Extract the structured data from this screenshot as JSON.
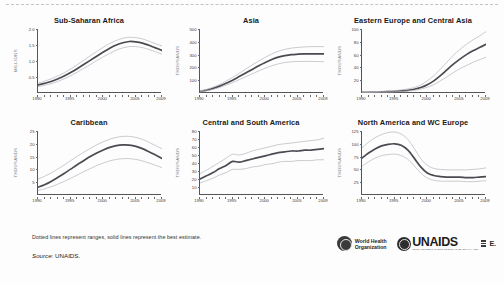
{
  "figure": {
    "note": "Dotted lines represent ranges, solid lines represent the best estimate.",
    "source_label": "Source:",
    "source_value": "UNAIDS."
  },
  "logos": {
    "who": {
      "line1": "World Health",
      "line2": "Organization",
      "mark": "who-emblem-icon"
    },
    "unaids": {
      "word": "UNAIDS",
      "subtitle": "JOINT UNITED NATIONS PROGRAMME ON HIV/AIDS",
      "mark": "unaids-emblem-icon"
    }
  },
  "chart_data": [
    {
      "type": "line",
      "title": "Sub-Saharan Africa",
      "xlabel": "",
      "ylabel": "MILLIONS",
      "xlim": [
        1990,
        2009
      ],
      "ylim": [
        0,
        2.0
      ],
      "xticks": [
        1990,
        1995,
        2000,
        2005,
        2009
      ],
      "yticks": [
        0.5,
        1.0,
        1.5,
        2.0
      ],
      "ytick_labels": [
        "0.5",
        "1.0",
        "1.5",
        "2.0"
      ],
      "grid": false,
      "legend": "none",
      "x": [
        1990,
        1991,
        1992,
        1993,
        1994,
        1995,
        1996,
        1997,
        1998,
        1999,
        2000,
        2001,
        2002,
        2003,
        2004,
        2005,
        2006,
        2007,
        2008,
        2009
      ],
      "series": [
        {
          "name": "best estimate",
          "style": "solid",
          "values": [
            0.25,
            0.3,
            0.36,
            0.44,
            0.53,
            0.64,
            0.76,
            0.89,
            1.02,
            1.15,
            1.28,
            1.4,
            1.5,
            1.57,
            1.61,
            1.6,
            1.56,
            1.49,
            1.41,
            1.33
          ]
        },
        {
          "name": "upper range",
          "style": "dotted",
          "values": [
            0.31,
            0.37,
            0.44,
            0.53,
            0.63,
            0.75,
            0.88,
            1.02,
            1.16,
            1.3,
            1.43,
            1.55,
            1.64,
            1.71,
            1.74,
            1.73,
            1.69,
            1.62,
            1.54,
            1.47
          ]
        },
        {
          "name": "lower range",
          "style": "dotted",
          "values": [
            0.2,
            0.24,
            0.29,
            0.36,
            0.44,
            0.54,
            0.65,
            0.77,
            0.89,
            1.01,
            1.13,
            1.24,
            1.34,
            1.41,
            1.45,
            1.45,
            1.42,
            1.36,
            1.29,
            1.21
          ]
        }
      ]
    },
    {
      "type": "line",
      "title": "Asia",
      "xlabel": "",
      "ylabel": "THOUSANDS",
      "xlim": [
        1990,
        2009
      ],
      "ylim": [
        0,
        500
      ],
      "xticks": [
        1990,
        1995,
        2000,
        2005,
        2009
      ],
      "yticks": [
        100,
        200,
        300,
        400,
        500
      ],
      "ytick_labels": [
        "100",
        "200",
        "300",
        "400",
        "500"
      ],
      "grid": false,
      "legend": "none",
      "x": [
        1990,
        1991,
        1992,
        1993,
        1994,
        1995,
        1996,
        1997,
        1998,
        1999,
        2000,
        2001,
        2002,
        2003,
        2004,
        2005,
        2006,
        2007,
        2008,
        2009
      ],
      "series": [
        {
          "name": "best estimate",
          "style": "solid",
          "values": [
            12,
            22,
            36,
            54,
            76,
            100,
            128,
            156,
            184,
            212,
            238,
            262,
            280,
            292,
            300,
            303,
            305,
            306,
            306,
            305
          ]
        },
        {
          "name": "upper range",
          "style": "dotted",
          "values": [
            16,
            28,
            45,
            67,
            93,
            122,
            154,
            187,
            219,
            250,
            279,
            305,
            326,
            341,
            351,
            356,
            360,
            362,
            363,
            362
          ]
        },
        {
          "name": "lower range",
          "style": "dotted",
          "values": [
            9,
            17,
            28,
            43,
            61,
            81,
            104,
            127,
            150,
            173,
            194,
            213,
            228,
            238,
            244,
            246,
            247,
            247,
            246,
            244
          ]
        }
      ]
    },
    {
      "type": "line",
      "title": "Eastern Europe and Central Asia",
      "xlabel": "",
      "ylabel": "THOUSANDS",
      "xlim": [
        1990,
        2009
      ],
      "ylim": [
        0,
        100
      ],
      "xticks": [
        1990,
        1995,
        2000,
        2005,
        2009
      ],
      "yticks": [
        20,
        40,
        60,
        80,
        100
      ],
      "ytick_labels": [
        "20",
        "40",
        "60",
        "80",
        "100"
      ],
      "grid": false,
      "legend": "none",
      "x": [
        1990,
        1991,
        1992,
        1993,
        1994,
        1995,
        1996,
        1997,
        1998,
        1999,
        2000,
        2001,
        2002,
        2003,
        2004,
        2005,
        2006,
        2007,
        2008,
        2009
      ],
      "series": [
        {
          "name": "best estimate",
          "style": "solid",
          "values": [
            1.0,
            1.2,
            1.4,
            1.7,
            2.0,
            2.5,
            3.2,
            4.2,
            5.8,
            8.5,
            13,
            19,
            27,
            36,
            45,
            53,
            60,
            66,
            71,
            76
          ]
        },
        {
          "name": "upper range",
          "style": "dotted",
          "values": [
            1.6,
            1.9,
            2.2,
            2.6,
            3.1,
            3.8,
            4.8,
            6.3,
            8.6,
            12.5,
            19,
            27,
            37,
            48,
            59,
            68,
            76,
            83,
            89,
            96
          ]
        },
        {
          "name": "lower range",
          "style": "dotted",
          "values": [
            0.7,
            0.8,
            1.0,
            1.2,
            1.4,
            1.8,
            2.3,
            3.0,
            4.1,
            6.0,
            9,
            13,
            19,
            25,
            32,
            38,
            43,
            48,
            52,
            56
          ]
        }
      ]
    },
    {
      "type": "line",
      "title": "Caribbean",
      "xlabel": "",
      "ylabel": "THOUSANDS",
      "xlim": [
        1990,
        2009
      ],
      "ylim": [
        0,
        25
      ],
      "xticks": [
        1990,
        1995,
        2000,
        2005,
        2009
      ],
      "yticks": [
        5,
        10,
        15,
        20,
        25
      ],
      "ytick_labels": [
        "5",
        "10",
        "15",
        "20",
        "25"
      ],
      "grid": false,
      "legend": "none",
      "x": [
        1990,
        1991,
        1992,
        1993,
        1994,
        1995,
        1996,
        1997,
        1998,
        1999,
        2000,
        2001,
        2002,
        2003,
        2004,
        2005,
        2006,
        2007,
        2008,
        2009
      ],
      "series": [
        {
          "name": "best estimate",
          "style": "solid",
          "values": [
            3.0,
            4.0,
            5.3,
            6.8,
            8.4,
            10.1,
            11.8,
            13.4,
            15.0,
            16.4,
            17.6,
            18.6,
            19.3,
            19.6,
            19.5,
            19.0,
            18.1,
            16.9,
            15.6,
            14.3
          ]
        },
        {
          "name": "upper range",
          "style": "dotted",
          "values": [
            6.2,
            7.3,
            8.6,
            10.1,
            11.7,
            13.4,
            15.1,
            16.7,
            18.2,
            19.6,
            20.8,
            21.8,
            22.5,
            22.9,
            22.9,
            22.5,
            21.7,
            20.6,
            19.3,
            18.1
          ]
        },
        {
          "name": "lower range",
          "style": "dotted",
          "values": [
            1.8,
            2.4,
            3.2,
            4.2,
            5.3,
            6.5,
            7.8,
            9.1,
            10.3,
            11.5,
            12.5,
            13.3,
            13.9,
            14.2,
            14.2,
            13.9,
            13.3,
            12.5,
            11.6,
            10.7
          ]
        }
      ]
    },
    {
      "type": "line",
      "title": "Central and South America",
      "xlabel": "",
      "ylabel": "THOUSANDS",
      "xlim": [
        1990,
        2009
      ],
      "ylim": [
        0,
        80
      ],
      "xticks": [
        1990,
        1995,
        2000,
        2005,
        2009
      ],
      "yticks": [
        10,
        20,
        30,
        40,
        50,
        60,
        70,
        80
      ],
      "ytick_labels": [
        "10",
        "20",
        "30",
        "40",
        "50",
        "60",
        "70",
        "80"
      ],
      "grid": false,
      "legend": "none",
      "x": [
        1990,
        1991,
        1992,
        1993,
        1994,
        1995,
        1996,
        1997,
        1998,
        1999,
        2000,
        2001,
        2002,
        2003,
        2004,
        2005,
        2006,
        2007,
        2008,
        2009
      ],
      "series": [
        {
          "name": "best estimate",
          "style": "solid",
          "values": [
            20,
            24,
            28,
            33,
            37,
            42,
            41,
            43,
            45,
            47,
            49,
            51,
            53,
            54,
            55,
            55,
            56,
            56,
            57,
            58
          ]
        },
        {
          "name": "upper range",
          "style": "dotted",
          "values": [
            27,
            31,
            36,
            41,
            46,
            51,
            50,
            52,
            55,
            57,
            59,
            61,
            63,
            64,
            65,
            66,
            67,
            68,
            69,
            71
          ]
        },
        {
          "name": "lower range",
          "style": "dotted",
          "values": [
            15,
            18,
            21,
            25,
            28,
            32,
            32,
            33,
            35,
            36,
            38,
            39,
            41,
            42,
            42,
            43,
            43,
            43,
            44,
            44
          ]
        }
      ]
    },
    {
      "type": "line",
      "title": "North America and WC Europe",
      "xlabel": "",
      "ylabel": "THOUSANDS",
      "xlim": [
        1990,
        2009
      ],
      "ylim": [
        0,
        125
      ],
      "xticks": [
        1990,
        1995,
        2000,
        2005,
        2009
      ],
      "yticks": [
        25,
        50,
        75,
        100,
        125
      ],
      "ytick_labels": [
        "25",
        "50",
        "75",
        "100",
        "125"
      ],
      "grid": false,
      "legend": "none",
      "x": [
        1990,
        1991,
        1992,
        1993,
        1994,
        1995,
        1996,
        1997,
        1998,
        1999,
        2000,
        2001,
        2002,
        2003,
        2004,
        2005,
        2006,
        2007,
        2008,
        2009
      ],
      "series": [
        {
          "name": "best estimate",
          "style": "solid",
          "values": [
            72,
            82,
            90,
            96,
            99,
            100,
            97,
            88,
            72,
            55,
            43,
            38,
            36,
            35,
            35,
            35,
            34,
            34,
            35,
            36
          ]
        },
        {
          "name": "upper range",
          "style": "dotted",
          "values": [
            92,
            103,
            112,
            118,
            122,
            123,
            119,
            109,
            91,
            71,
            58,
            52,
            50,
            49,
            49,
            49,
            49,
            50,
            51,
            53
          ]
        },
        {
          "name": "lower range",
          "style": "dotted",
          "values": [
            56,
            65,
            72,
            77,
            79,
            80,
            77,
            70,
            57,
            43,
            33,
            29,
            27,
            27,
            27,
            27,
            26,
            26,
            27,
            28
          ]
        }
      ]
    }
  ]
}
